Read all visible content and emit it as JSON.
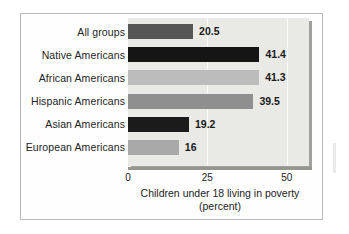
{
  "chart_data": {
    "type": "bar",
    "orientation": "horizontal",
    "title": "",
    "xlabel": "Children under 18 living in poverty (percent)",
    "ylabel": "",
    "xlim": [
      0,
      57
    ],
    "ticks": [
      {
        "value": 0,
        "label": "0"
      },
      {
        "value": 25,
        "label": "25"
      },
      {
        "value": 50,
        "label": "50"
      }
    ],
    "grid": true,
    "legend": "none",
    "categories": [
      "All groups",
      "Native Americans",
      "African Americans",
      "Hispanic Americans",
      "Asian Americans",
      "European Americans"
    ],
    "values": [
      20.5,
      41.4,
      41.3,
      39.5,
      19.2,
      16
    ],
    "value_labels": [
      "20.5",
      "41.4",
      "41.3",
      "39.5",
      "19.2",
      "16"
    ],
    "bar_colors": [
      "#565656",
      "#151515",
      "#bcbcbc",
      "#8f8f8f",
      "#1b1b1b",
      "#a9a9a9"
    ],
    "caption": {
      "line1": "Children under 18 living in poverty",
      "line2": "(percent)"
    }
  },
  "style": {
    "panel_background": "#e9e9e6",
    "panel_shadow": "#a0a09c",
    "frame_border": "#b9b9b5",
    "axis_color": "#96968f",
    "gridline_color": "#fdfdfc",
    "text_color": "#232323"
  }
}
